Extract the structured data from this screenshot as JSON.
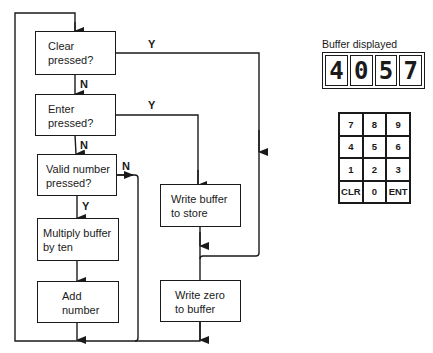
{
  "flowchart": {
    "boxes": [
      {
        "id": "clear",
        "text_line1": "Clear",
        "text_line2": "pressed?"
      },
      {
        "id": "enter",
        "text_line1": "Enter",
        "text_line2": "pressed?"
      },
      {
        "id": "valid",
        "text_line1": "Valid number",
        "text_line2": "pressed?"
      },
      {
        "id": "multiply",
        "text_line1": "Multiply buffer",
        "text_line2": "by ten"
      },
      {
        "id": "add",
        "text_line1": "Add",
        "text_line2": "number"
      },
      {
        "id": "write_store",
        "text_line1": "Write buffer",
        "text_line2": "to store"
      },
      {
        "id": "write_zero",
        "text_line1": "Write zero",
        "text_line2": "to buffer"
      }
    ],
    "edge_labels": {
      "clear_yes": "Y",
      "clear_no": "N",
      "enter_yes": "Y",
      "enter_no": "N",
      "valid_no": "N",
      "valid_yes": "Y"
    }
  },
  "display": {
    "label": "Buffer displayed",
    "digits": [
      "4",
      "0",
      "5",
      "7"
    ]
  },
  "keypad": {
    "keys": [
      "7",
      "8",
      "9",
      "4",
      "5",
      "6",
      "1",
      "2",
      "3",
      "CLR",
      "0",
      "ENT"
    ]
  }
}
